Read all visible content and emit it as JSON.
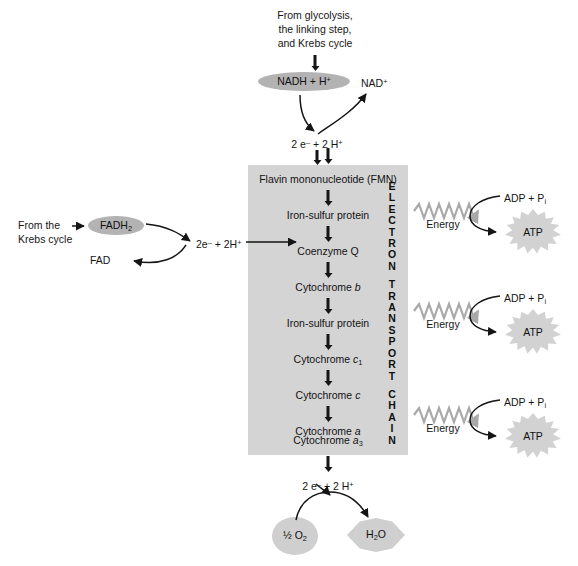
{
  "diagram": {
    "title": "Electron Transport Chain",
    "colors": {
      "panel_gray": "#d4d4d4",
      "pill_gray": "#b3b3b3",
      "blob_gray": "#cfcfcf",
      "burst_gray": "#d2d2d2",
      "squiggle_gray": "#a9a9a9",
      "ink": "#151515"
    }
  },
  "top": {
    "source_line1": "From glycolysis,",
    "source_line2": "the linking step,",
    "source_line3": "and Krebs cycle",
    "nadh_label": "NADH + H",
    "nadh_sup": "+",
    "nad_label": "NAD",
    "nad_sup": "+",
    "electrons_label_a": "2 e",
    "electrons_sup_a": "–",
    "electrons_label_b": " + 2 H",
    "electrons_sup_b": "+"
  },
  "left": {
    "from_line1": "From the",
    "from_line2": "Krebs cycle",
    "fadh2_label": "FADH",
    "fadh2_sub": "2",
    "fad_label": "FAD",
    "electrons_label_a": "2e",
    "electrons_sup_a": "–",
    "electrons_label_b": " + 2H",
    "electrons_sup_b": "+"
  },
  "etc": {
    "vertical_label": "ELECTRON TRANSPORT CHAIN",
    "vertical_words": [
      "ELECTRON",
      "TRANSPORT",
      "CHAIN"
    ],
    "steps": [
      {
        "name": "Flavin mononucleotide (FMN)",
        "italic_tail": ""
      },
      {
        "name": "Iron-sulfur protein",
        "italic_tail": ""
      },
      {
        "name": "Coenzyme Q",
        "italic_tail": ""
      },
      {
        "name": "Cytochrome ",
        "italic_tail": "b"
      },
      {
        "name": "Iron-sulfur protein",
        "italic_tail": ""
      },
      {
        "name": "Cytochrome ",
        "italic_tail": "c",
        "sub": "1"
      },
      {
        "name": "Cytochrome ",
        "italic_tail": "c"
      },
      {
        "name": "Cytochrome ",
        "italic_tail": "a"
      },
      {
        "name": "Cytochrome ",
        "italic_tail": "a",
        "sub": "3"
      }
    ]
  },
  "energy_groups": [
    {
      "energy_label": "Energy",
      "adp_label": "ADP + P",
      "adp_sub": "i",
      "atp_label": "ATP"
    },
    {
      "energy_label": "Energy",
      "adp_label": "ADP + P",
      "adp_sub": "i",
      "atp_label": "ATP"
    },
    {
      "energy_label": "Energy",
      "adp_label": "ADP + P",
      "adp_sub": "i",
      "atp_label": "ATP"
    }
  ],
  "bottom": {
    "electrons_label_a": "2 e",
    "electrons_sup_a": "–",
    "electrons_label_b": " + 2 H",
    "electrons_sup_b": "+",
    "oxygen_frac": "½",
    "oxygen_label": " O",
    "oxygen_sub": "2",
    "water_label_a": "H",
    "water_sub": "2",
    "water_label_b": "O"
  }
}
